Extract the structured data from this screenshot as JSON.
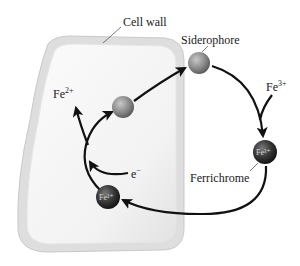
{
  "diagram": {
    "labels": {
      "cell_wall": "Cell wall",
      "siderophore": "Siderophore",
      "ferrichrome": "Ferrichrome",
      "fe3_base": "Fe",
      "fe3_charge": "3+",
      "fe2_base": "Fe",
      "fe2_charge": "2+",
      "electron_base": "e",
      "electron_charge": "−",
      "ball_fe3_outer": "Fe³⁺",
      "ball_fe3_inner": "Fe³⁺"
    },
    "nodes": [
      {
        "id": "siderophore-outside",
        "label": "Siderophore",
        "color": "#8f8f8f",
        "location": "outside cell"
      },
      {
        "id": "ferrichrome-outside",
        "label": "Ferrichrome (Fe³⁺ bound)",
        "color": "#3a3a3a",
        "location": "outside cell"
      },
      {
        "id": "ferrichrome-inside",
        "label": "Fe³⁺ complex",
        "color": "#3a3a3a",
        "location": "inside cell"
      },
      {
        "id": "siderophore-inside",
        "label": "Siderophore (released)",
        "color": "#8f8f8f",
        "location": "inside cell"
      }
    ],
    "edges": [
      {
        "from": "Fe³⁺ (environment)",
        "to": "ferrichrome-outside"
      },
      {
        "from": "siderophore-outside",
        "to": "ferrichrome-outside"
      },
      {
        "from": "ferrichrome-outside",
        "to": "ferrichrome-inside",
        "note": "crosses cell wall"
      },
      {
        "from": "ferrichrome-inside",
        "to": "siderophore-inside"
      },
      {
        "from": "e⁻",
        "to": "reduction step"
      },
      {
        "from": "reduction step",
        "to": "Fe²⁺"
      },
      {
        "from": "siderophore-inside",
        "to": "siderophore-outside",
        "note": "exported"
      }
    ],
    "colors": {
      "cell_wall_outer": "#d9d9d9",
      "cell_wall_inner": "#f4f4f4",
      "arrow": "#111111",
      "siderophore": "#8f8f8f",
      "ferrichrome": "#333333"
    }
  }
}
